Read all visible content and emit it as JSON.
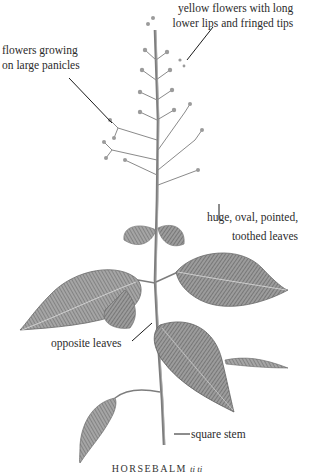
{
  "figure": {
    "subject": "Horsebalm",
    "caption": "HORSEBALM",
    "caption_latin": "ti ti",
    "annotations": [
      {
        "id": "flowers",
        "lines": [
          "yellow flowers with long",
          "lower lips and fringed tips"
        ]
      },
      {
        "id": "panicles",
        "lines": [
          "flowers growing",
          "on large panicles"
        ]
      },
      {
        "id": "leaves",
        "lines": [
          "huge, oval, pointed,",
          "toothed leaves"
        ]
      },
      {
        "id": "opposite",
        "lines": [
          "opposite leaves"
        ]
      },
      {
        "id": "stem",
        "lines": [
          "square stem"
        ]
      }
    ],
    "colors": {
      "background": "#ffffff",
      "text": "#2b2b2b",
      "leaf_fill": "#8a8a8a",
      "leaf_dark": "#5a5a5a",
      "stem": "#7a7a7a",
      "leader_line": "#1a1a1a"
    }
  }
}
